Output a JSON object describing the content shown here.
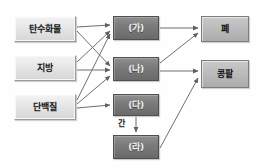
{
  "diagram": {
    "colors": {
      "source_box_fill": "#e6e6e6",
      "source_box_border": "#9a9a9a",
      "middle_box_fill": "#7b7b7b",
      "middle_box_border": "#4f4f4f",
      "target_box_fill": "#bcbcbc",
      "target_box_border": "#7d7d7d",
      "arrow": "#6f6f6f",
      "background": "#fefefe"
    },
    "nodes": [
      {
        "id": "carb",
        "label": "탄수화물",
        "group": "source",
        "x": 14,
        "y": 16,
        "w": 62,
        "h": 26
      },
      {
        "id": "fat",
        "label": "지방",
        "group": "source",
        "x": 14,
        "y": 55,
        "w": 62,
        "h": 26
      },
      {
        "id": "protein",
        "label": "단백질",
        "group": "source",
        "x": 14,
        "y": 94,
        "w": 62,
        "h": 26
      },
      {
        "id": "ga",
        "label": "(가)",
        "group": "middle",
        "x": 113,
        "y": 16,
        "w": 46,
        "h": 24
      },
      {
        "id": "na",
        "label": "(나)",
        "group": "middle",
        "x": 113,
        "y": 57,
        "w": 46,
        "h": 24
      },
      {
        "id": "da",
        "label": "(다)",
        "group": "middle",
        "x": 113,
        "y": 94,
        "w": 46,
        "h": 22
      },
      {
        "id": "ra",
        "label": "(라)",
        "group": "middle",
        "x": 113,
        "y": 135,
        "w": 46,
        "h": 24
      },
      {
        "id": "lung",
        "label": "폐",
        "group": "target",
        "x": 201,
        "y": 16,
        "w": 48,
        "h": 26
      },
      {
        "id": "kidney",
        "label": "콩팥",
        "group": "target",
        "x": 201,
        "y": 60,
        "w": 48,
        "h": 28
      }
    ],
    "edge_labels": [
      {
        "id": "liver",
        "label": "간",
        "x": 118,
        "y": 120
      }
    ],
    "edges": [
      {
        "from": "carb",
        "to": "ga",
        "x1": 77,
        "y1": 27,
        "x2": 110,
        "y2": 25
      },
      {
        "from": "carb",
        "to": "na",
        "x1": 77,
        "y1": 31,
        "x2": 110,
        "y2": 66
      },
      {
        "from": "fat",
        "to": "ga",
        "x1": 77,
        "y1": 62,
        "x2": 110,
        "y2": 31
      },
      {
        "from": "fat",
        "to": "na",
        "x1": 77,
        "y1": 70,
        "x2": 110,
        "y2": 70
      },
      {
        "from": "protein",
        "to": "ga",
        "x1": 77,
        "y1": 100,
        "x2": 110,
        "y2": 34
      },
      {
        "from": "protein",
        "to": "na",
        "x1": 77,
        "y1": 104,
        "x2": 110,
        "y2": 76
      },
      {
        "from": "protein",
        "to": "da",
        "x1": 77,
        "y1": 108,
        "x2": 110,
        "y2": 105
      },
      {
        "from": "da",
        "to": "ra",
        "x1": 136,
        "y1": 117,
        "x2": 136,
        "y2": 132
      },
      {
        "from": "ga",
        "to": "lung",
        "x1": 160,
        "y1": 28,
        "x2": 198,
        "y2": 28
      },
      {
        "from": "na",
        "to": "lung",
        "x1": 160,
        "y1": 63,
        "x2": 198,
        "y2": 33
      },
      {
        "from": "na",
        "to": "kidney",
        "x1": 160,
        "y1": 71,
        "x2": 198,
        "y2": 71
      },
      {
        "from": "ra",
        "to": "kidney",
        "x1": 160,
        "y1": 148,
        "x2": 198,
        "y2": 78
      }
    ]
  }
}
